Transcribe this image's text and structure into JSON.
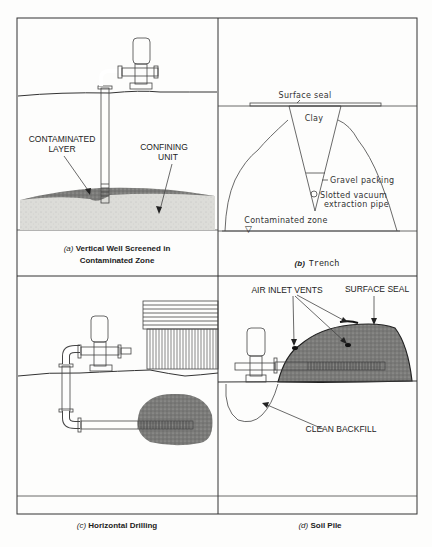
{
  "figure": {
    "panels": [
      {
        "id": "a",
        "caption_letter": "(a)",
        "caption_line1": "Vertical Well Screened in",
        "caption_line2": "Contaminated Zone",
        "labels": {
          "contaminated_layer_1": "CONTAMINATED",
          "contaminated_layer_2": "LAYER",
          "confining_unit_1": "CONFINING",
          "confining_unit_2": "UNIT"
        }
      },
      {
        "id": "b",
        "caption_letter": "(b)",
        "caption_text": "Trench",
        "labels": {
          "surface_seal": "Surface seal",
          "clay": "Clay",
          "gravel_packing": "Gravel packing",
          "slotted_pipe_1": "Slotted vacuum",
          "slotted_pipe_2": "extraction pipe",
          "contaminated_zone": "Contaminated zone",
          "water_table_symbol": "▽"
        }
      },
      {
        "id": "c",
        "caption_letter": "(c)",
        "caption_text": "Horizontal Drilling"
      },
      {
        "id": "d",
        "caption_letter": "(d)",
        "caption_text": "Soil Pile",
        "labels": {
          "air_inlet_vents": "AIR INLET VENTS",
          "surface_seal": "SURFACE SEAL",
          "clean_backfill": "CLEAN BACKFILL"
        }
      }
    ],
    "colors": {
      "line": "#333333",
      "contaminant_fill": "#777777",
      "confining_fill": "#d8d8d4",
      "background": "#fdfdfc"
    }
  }
}
